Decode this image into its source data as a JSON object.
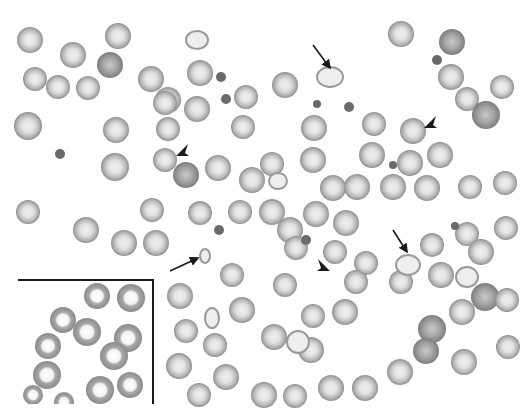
{
  "image": {
    "type": "micrograph",
    "subject": "peripheral blood smear, red blood cells",
    "background_color": "#ffffff",
    "cell_rim_color": "#8f8f8f",
    "cell_center_color": "#e6e6e6",
    "dense_cell_color": "#8a8a8a",
    "platelet_color": "#6a6a6a",
    "annotation_color": "#1a1a1a"
  },
  "annotations": {
    "arrows": [
      {
        "label": "arrow-1",
        "tail": [
          313,
          45
        ],
        "head": [
          330,
          68
        ]
      },
      {
        "label": "arrow-2",
        "tail": [
          170,
          271
        ],
        "head": [
          198,
          258
        ]
      },
      {
        "label": "arrow-3",
        "tail": [
          393,
          230
        ],
        "head": [
          407,
          252
        ]
      }
    ],
    "arrowheads": [
      {
        "label": "arrowhead-1",
        "at": [
          183,
          150
        ],
        "direction": "down-left"
      },
      {
        "label": "arrowhead-2",
        "at": [
          431,
          122
        ],
        "direction": "down-left"
      },
      {
        "label": "arrowhead-3",
        "at": [
          323,
          265
        ],
        "direction": "down-right"
      }
    ],
    "inset_box": {
      "x": 18,
      "y": 280,
      "width": 135,
      "height": 124
    }
  },
  "cells": [
    [
      30,
      40,
      13,
      "n"
    ],
    [
      73,
      55,
      13,
      "n"
    ],
    [
      118,
      36,
      13,
      "n"
    ],
    [
      110,
      65,
      13,
      "d"
    ],
    [
      151,
      79,
      13,
      "n"
    ],
    [
      35,
      79,
      12,
      "n"
    ],
    [
      88,
      88,
      12,
      "n"
    ],
    [
      58,
      87,
      12,
      "n"
    ],
    [
      168,
      100,
      13,
      "n"
    ],
    [
      200,
      73,
      13,
      "n"
    ],
    [
      197,
      109,
      13,
      "n"
    ],
    [
      246,
      97,
      12,
      "n"
    ],
    [
      243,
      127,
      12,
      "n"
    ],
    [
      28,
      126,
      14,
      "n"
    ],
    [
      116,
      130,
      13,
      "n"
    ],
    [
      168,
      129,
      12,
      "n"
    ],
    [
      165,
      160,
      12,
      "n"
    ],
    [
      186,
      175,
      13,
      "d"
    ],
    [
      115,
      167,
      14,
      "n"
    ],
    [
      252,
      180,
      13,
      "n"
    ],
    [
      285,
      85,
      13,
      "n"
    ],
    [
      314,
      128,
      13,
      "n"
    ],
    [
      313,
      160,
      13,
      "n"
    ],
    [
      333,
      188,
      13,
      "n"
    ],
    [
      374,
      124,
      12,
      "n"
    ],
    [
      401,
      34,
      13,
      "n"
    ],
    [
      452,
      42,
      13,
      "d"
    ],
    [
      451,
      77,
      13,
      "n"
    ],
    [
      467,
      99,
      12,
      "n"
    ],
    [
      486,
      115,
      14,
      "d"
    ],
    [
      502,
      87,
      12,
      "n"
    ],
    [
      413,
      131,
      13,
      "n"
    ],
    [
      372,
      155,
      13,
      "n"
    ],
    [
      440,
      155,
      13,
      "n"
    ],
    [
      410,
      163,
      13,
      "n"
    ],
    [
      427,
      188,
      13,
      "n"
    ],
    [
      470,
      187,
      12,
      "n"
    ],
    [
      505,
      183,
      12,
      "n"
    ],
    [
      272,
      164,
      12,
      "n"
    ],
    [
      218,
      168,
      13,
      "n"
    ],
    [
      165,
      103,
      12,
      "n"
    ],
    [
      28,
      212,
      12,
      "n"
    ],
    [
      86,
      230,
      13,
      "n"
    ],
    [
      124,
      243,
      13,
      "n"
    ],
    [
      156,
      243,
      13,
      "n"
    ],
    [
      152,
      210,
      12,
      "n"
    ],
    [
      200,
      213,
      12,
      "n"
    ],
    [
      240,
      212,
      12,
      "n"
    ],
    [
      272,
      212,
      13,
      "n"
    ],
    [
      290,
      230,
      13,
      "n"
    ],
    [
      316,
      214,
      13,
      "n"
    ],
    [
      346,
      223,
      13,
      "n"
    ],
    [
      357,
      187,
      13,
      "n"
    ],
    [
      393,
      187,
      13,
      "n"
    ],
    [
      335,
      252,
      12,
      "n"
    ],
    [
      366,
      263,
      12,
      "n"
    ],
    [
      401,
      282,
      12,
      "n"
    ],
    [
      432,
      245,
      12,
      "n"
    ],
    [
      467,
      234,
      12,
      "n"
    ],
    [
      506,
      228,
      12,
      "n"
    ],
    [
      481,
      252,
      13,
      "n"
    ],
    [
      441,
      275,
      13,
      "n"
    ],
    [
      485,
      297,
      14,
      "d"
    ],
    [
      462,
      312,
      13,
      "n"
    ],
    [
      432,
      329,
      14,
      "d"
    ],
    [
      356,
      282,
      12,
      "n"
    ],
    [
      345,
      312,
      13,
      "n"
    ],
    [
      296,
      248,
      12,
      "n"
    ],
    [
      285,
      285,
      12,
      "n"
    ],
    [
      313,
      316,
      12,
      "n"
    ],
    [
      274,
      337,
      13,
      "n"
    ],
    [
      311,
      350,
      13,
      "n"
    ],
    [
      331,
      388,
      13,
      "n"
    ],
    [
      232,
      275,
      12,
      "n"
    ],
    [
      242,
      310,
      13,
      "n"
    ],
    [
      215,
      345,
      12,
      "n"
    ],
    [
      226,
      377,
      13,
      "n"
    ],
    [
      180,
      296,
      13,
      "n"
    ],
    [
      186,
      331,
      12,
      "n"
    ],
    [
      179,
      366,
      13,
      "n"
    ],
    [
      199,
      395,
      12,
      "n"
    ],
    [
      264,
      395,
      13,
      "n"
    ],
    [
      295,
      396,
      12,
      "n"
    ],
    [
      365,
      388,
      13,
      "n"
    ],
    [
      400,
      372,
      13,
      "n"
    ],
    [
      426,
      351,
      13,
      "d"
    ],
    [
      464,
      362,
      13,
      "n"
    ],
    [
      507,
      300,
      12,
      "n"
    ],
    [
      508,
      347,
      12,
      "n"
    ],
    [
      132,
      283,
      12,
      "n"
    ],
    [
      140,
      340,
      10,
      "n"
    ],
    [
      152,
      370,
      11,
      "n"
    ],
    [
      140,
      391,
      11,
      "n"
    ]
  ],
  "inset_cells": [
    [
      63,
      320,
      13
    ],
    [
      97,
      296,
      13
    ],
    [
      131,
      298,
      14
    ],
    [
      48,
      346,
      13
    ],
    [
      87,
      332,
      14
    ],
    [
      128,
      338,
      14
    ],
    [
      114,
      356,
      14
    ],
    [
      47,
      375,
      14
    ],
    [
      100,
      390,
      14
    ],
    [
      130,
      385,
      13
    ],
    [
      33,
      395,
      10
    ],
    [
      64,
      402,
      10
    ]
  ],
  "platelets": [
    [
      221,
      77,
      5
    ],
    [
      226,
      99,
      5
    ],
    [
      60,
      154,
      5
    ],
    [
      317,
      104,
      4
    ],
    [
      349,
      107,
      5
    ],
    [
      437,
      60,
      5
    ],
    [
      393,
      165,
      4
    ],
    [
      306,
      240,
      5
    ],
    [
      455,
      226,
      4
    ],
    [
      219,
      230,
      5
    ]
  ],
  "irregular_cells": [
    {
      "label": "arrowed-cell-1",
      "x": 330,
      "y": 77,
      "w": 26,
      "h": 20
    },
    {
      "label": "arrowed-cell-2",
      "x": 205,
      "y": 256,
      "w": 10,
      "h": 14
    },
    {
      "label": "arrowed-cell-3",
      "x": 408,
      "y": 265,
      "w": 24,
      "h": 20
    },
    {
      "label": "misshapen-cell-1",
      "x": 278,
      "y": 181,
      "w": 18,
      "h": 16
    },
    {
      "label": "misshapen-cell-2",
      "x": 212,
      "y": 318,
      "w": 14,
      "h": 20
    },
    {
      "label": "misshapen-cell-3",
      "x": 298,
      "y": 342,
      "w": 22,
      "h": 22
    },
    {
      "label": "teardrop-cell",
      "x": 197,
      "y": 40,
      "w": 22,
      "h": 18
    },
    {
      "label": "spiculated-cell",
      "x": 467,
      "y": 277,
      "w": 22,
      "h": 20
    }
  ]
}
